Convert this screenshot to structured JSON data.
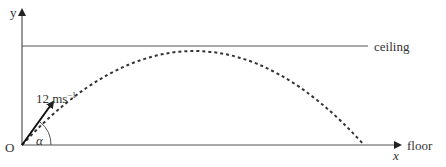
{
  "diagram": {
    "type": "projectile-motion",
    "axes": {
      "x_label": "x",
      "y_label": "y",
      "origin_label": "O"
    },
    "lines": {
      "ceiling_label": "ceiling",
      "floor_label": "floor"
    },
    "velocity": {
      "magnitude": "12",
      "unit": "ms",
      "unit_exponent": "−1"
    },
    "angle_label": "α",
    "colors": {
      "lines": "#555555",
      "trajectory": "#333333",
      "arrow": "#111111"
    }
  }
}
